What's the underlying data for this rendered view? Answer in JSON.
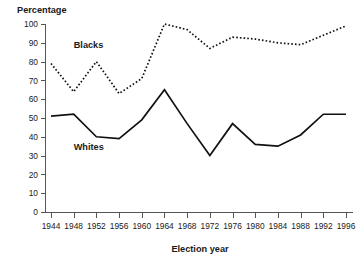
{
  "chart_data": {
    "type": "line",
    "title": "",
    "xlabel": "Election year",
    "ylabel": "Percentage",
    "ylim": [
      0,
      100
    ],
    "grid": false,
    "legend_position": "inline-annotation",
    "x": [
      1944,
      1948,
      1952,
      1956,
      1960,
      1964,
      1968,
      1972,
      1976,
      1980,
      1984,
      1988,
      1992,
      1996
    ],
    "categories": [
      "1944",
      "1948",
      "1952",
      "1956",
      "1960",
      "1964",
      "1968",
      "1972",
      "1976",
      "1980",
      "1984",
      "1988",
      "1992",
      "1996"
    ],
    "yticks": [
      0,
      10,
      20,
      30,
      40,
      50,
      60,
      70,
      80,
      90,
      100
    ],
    "series": [
      {
        "name": "Blacks",
        "style": "dashed",
        "color": "#111111",
        "values": [
          79,
          64,
          80,
          63,
          71,
          100,
          97,
          87,
          93,
          92,
          90,
          89,
          94,
          99
        ]
      },
      {
        "name": "Whites",
        "style": "solid",
        "color": "#111111",
        "values": [
          51,
          52,
          40,
          39,
          49,
          65,
          47,
          30,
          47,
          36,
          35,
          41,
          52,
          52
        ]
      }
    ],
    "annotations": [
      {
        "text": "Blacks",
        "x": 1948,
        "y": 87
      },
      {
        "text": "Whites",
        "x": 1948,
        "y": 33
      }
    ]
  },
  "axis": {
    "y_title": "Percentage",
    "x_title": "Election year"
  }
}
